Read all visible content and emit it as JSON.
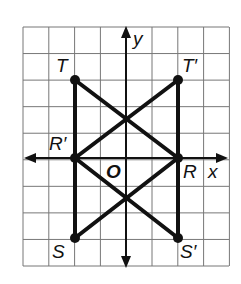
{
  "figure": {
    "axes": {
      "x_label": "x",
      "y_label": "y",
      "origin_label": "O"
    },
    "grid": {
      "left": 23,
      "top": 27,
      "right": 229,
      "bottom": 266,
      "cell": 25.8
    },
    "points": [
      {
        "name": "T",
        "label": "T",
        "x": 75,
        "y": 80,
        "lx": 56,
        "ly": 72
      },
      {
        "name": "T-prime",
        "label": "T′",
        "x": 178,
        "y": 80,
        "lx": 182,
        "ly": 72
      },
      {
        "name": "R-prime",
        "label": "R′",
        "x": 75,
        "y": 158,
        "lx": 49,
        "ly": 150
      },
      {
        "name": "R",
        "label": "R",
        "x": 178,
        "y": 158,
        "lx": 183,
        "ly": 178
      },
      {
        "name": "S",
        "label": "S",
        "x": 75,
        "y": 238,
        "lx": 52,
        "ly": 258
      },
      {
        "name": "S-prime",
        "label": "S′",
        "x": 178,
        "y": 238,
        "lx": 180,
        "ly": 258
      }
    ],
    "segments": [
      [
        "T",
        "R-prime"
      ],
      [
        "R-prime",
        "S"
      ],
      [
        "T",
        "R"
      ],
      [
        "S",
        "R"
      ],
      [
        "T-prime",
        "R"
      ],
      [
        "R",
        "S-prime"
      ],
      [
        "T-prime",
        "R-prime"
      ],
      [
        "S-prime",
        "R-prime"
      ]
    ]
  }
}
